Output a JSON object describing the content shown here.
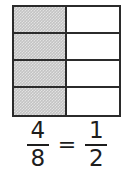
{
  "model": {
    "columns": 2,
    "rows": 4,
    "total_parts": 8,
    "shaded_parts": 4,
    "shaded_color": "#c3c3c3",
    "unshaded_color": "#ffffff",
    "border_color": "#2b2b2b",
    "cells": [
      {
        "shaded": true,
        "col": 1,
        "row": 1
      },
      {
        "shaded": false,
        "col": 2,
        "row": 1
      },
      {
        "shaded": true,
        "col": 1,
        "row": 2
      },
      {
        "shaded": false,
        "col": 2,
        "row": 2
      },
      {
        "shaded": true,
        "col": 1,
        "row": 3
      },
      {
        "shaded": false,
        "col": 2,
        "row": 3
      },
      {
        "shaded": true,
        "col": 1,
        "row": 4
      },
      {
        "shaded": false,
        "col": 2,
        "row": 4
      }
    ]
  },
  "equation": {
    "left_fraction": {
      "numerator": "4",
      "denominator": "8"
    },
    "operator": "=",
    "right_fraction": {
      "numerator": "1",
      "denominator": "2"
    },
    "text_color": "#1d1d1d"
  }
}
